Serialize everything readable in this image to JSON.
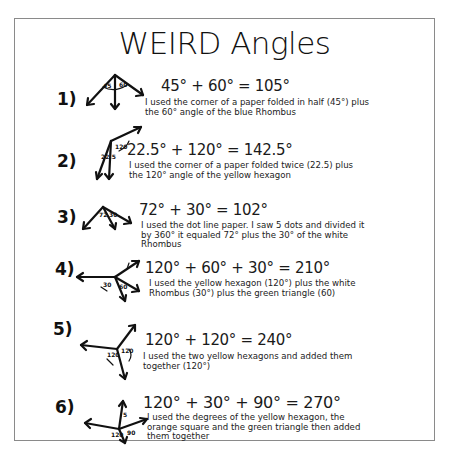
{
  "title": "WEIRD Angles",
  "items": [
    {
      "number": "1)",
      "equation": "45° + 60° = 105°",
      "description": "I used the corner of a paper folded in half (45°) plus the 60° angle of the blue Rhombus",
      "figure_labels": [
        "45",
        "60"
      ]
    },
    {
      "number": "2)",
      "equation": "22.5° + 120° = 142.5°",
      "description": "I used the corner of a paper folded twice (22.5) plus the 120° angle of the yellow hexagon",
      "figure_labels": [
        "22.5",
        "120"
      ]
    },
    {
      "number": "3)",
      "equation": "72° + 30° = 102°",
      "description": "I used the dot line paper. I saw 5 dots and divided it by 360° it equaled 72° plus the 30° of the white Rhombus",
      "figure_labels": [
        "72",
        "30"
      ]
    },
    {
      "number": "4)",
      "equation": "120° + 60° + 30° = 210°",
      "description": "I used the yellow hexagon (120°) plus the white Rhombus (30°) plus the green triangle (60)",
      "figure_labels": [
        "30",
        "60",
        "120"
      ]
    },
    {
      "number": "5)",
      "equation": "120° + 120° = 240°",
      "description": "I used the two yellow hexagons and added them together (120°)",
      "figure_labels": [
        "120",
        "120"
      ]
    },
    {
      "number": "6)",
      "equation": "120° + 30° + 90° = 270°",
      "description": "I used the degrees of the yellow hexagon, the orange square and the green triangle then added them together",
      "figure_labels": [
        "5",
        "120",
        "90"
      ]
    }
  ]
}
